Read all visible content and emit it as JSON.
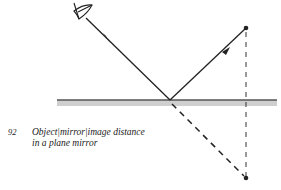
{
  "figure": {
    "number": "92",
    "caption_line1": "Object|mirror|image distance",
    "caption_line2": "in a plane mirror"
  },
  "elements": {
    "observer": "eye-icon",
    "object_point": "object-dot",
    "image_point": "image-dot",
    "mirror": "plane-mirror"
  },
  "colors": {
    "ink": "#222222",
    "mirror_fill": "#c8c8c8",
    "mirror_edge": "#555555"
  }
}
